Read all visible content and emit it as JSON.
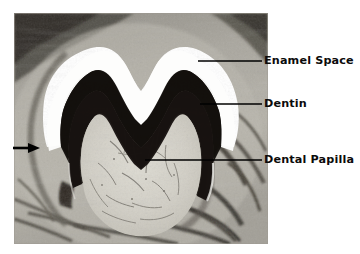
{
  "figure": {
    "type": "histology-micrograph",
    "background_color": "#ffffff"
  },
  "photo": {
    "name": "tooth-germ-micrograph",
    "x": 14,
    "y": 13,
    "width": 254,
    "height": 231,
    "regions": [
      {
        "name": "enamel-space",
        "appearance": "white M/W-shaped band",
        "color": "#ffffff"
      },
      {
        "name": "dentin",
        "appearance": "dark near-black band beneath enamel space",
        "color": "#14100e"
      },
      {
        "name": "dental-papilla",
        "appearance": "pale mottled core with fine dark fibers",
        "color": "#cfcdc4"
      },
      {
        "name": "surrounding-tissue",
        "appearance": "grey fibrous follicle and bone",
        "color": "#9a978f"
      }
    ]
  },
  "annotations": [
    {
      "id": "enamel-space",
      "label": "Enamel Space",
      "label_x": 264,
      "label_y": 55,
      "leader": {
        "x1": 198,
        "y1": 61,
        "x2": 262,
        "y2": 61
      }
    },
    {
      "id": "dentin",
      "label": "Dentin",
      "label_x": 264,
      "label_y": 98,
      "leader": {
        "x1": 200,
        "y1": 104,
        "x2": 262,
        "y2": 104
      }
    },
    {
      "id": "dental-papilla",
      "label": "Dental Papilla",
      "label_x": 264,
      "label_y": 154,
      "leader": {
        "x1": 145,
        "y1": 160,
        "x2": 262,
        "y2": 160
      }
    }
  ],
  "markers": [
    {
      "id": "left-arrow",
      "name": "pointer-arrow",
      "description": "solid black arrow pointing right at the cervical loop region",
      "x1": 13,
      "y1": 148,
      "x2": 39,
      "y2": 148,
      "color": "#000000"
    }
  ],
  "colors": {
    "line": "#000000",
    "text": "#0b0b0b",
    "page": "#ffffff"
  }
}
